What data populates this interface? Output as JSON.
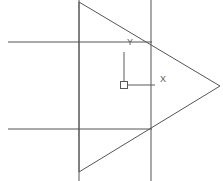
{
  "viewport": {
    "name": "cad-drawing-viewport",
    "width": 223,
    "height": 181,
    "background_color": "#ffffff",
    "line_color": "#555555",
    "ucs_color": "#5a5a5a"
  },
  "ucs_icon": {
    "x_axis_label": "X",
    "y_axis_label": "Y",
    "origin_x": 124,
    "origin_y": 85,
    "x_arm_end": 155,
    "y_arm_end": 52,
    "box_size": 7
  },
  "geometry": {
    "triangle": {
      "name": "arrow-triangle",
      "points": [
        [
          79,
          2
        ],
        [
          220,
          86
        ],
        [
          79,
          172
        ]
      ],
      "stroke": "#555555",
      "stroke_width": 1
    },
    "vertical_lines": [
      {
        "name": "construction-line-vertical-left",
        "x": 79,
        "y1": 0,
        "y2": 181
      },
      {
        "name": "construction-line-vertical-right",
        "x": 151,
        "y1": 0,
        "y2": 181
      }
    ],
    "horizontal_lines": [
      {
        "name": "construction-line-horizontal-top",
        "y": 42,
        "x1": 8,
        "x2": 152
      },
      {
        "name": "construction-line-horizontal-bottom",
        "y": 129,
        "x1": 8,
        "x2": 152
      }
    ]
  }
}
